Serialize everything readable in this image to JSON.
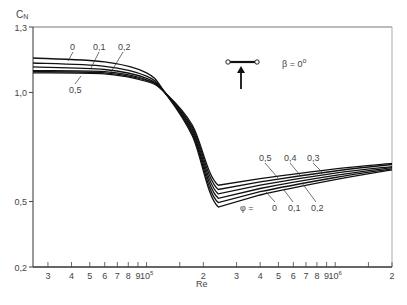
{
  "chart_data": {
    "type": "line",
    "title": "",
    "ylabel": "C_N",
    "xlabel": "Re",
    "x_scale": "log",
    "y_scale": "linear",
    "xlim": [
      25000,
      2000000
    ],
    "ylim": [
      0.2,
      1.3
    ],
    "y_ticks": [
      {
        "value": 1.3,
        "label": "1,3"
      },
      {
        "value": 1.0,
        "label": "1,0"
      },
      {
        "value": 0.5,
        "label": "0,5"
      },
      {
        "value": 0.2,
        "label": "0,2"
      }
    ],
    "x_ticks": [
      {
        "value": 30000,
        "label": "3"
      },
      {
        "value": 40000,
        "label": "4"
      },
      {
        "value": 50000,
        "label": "5"
      },
      {
        "value": 60000,
        "label": "6"
      },
      {
        "value": 70000,
        "label": "7"
      },
      {
        "value": 80000,
        "label": "8"
      },
      {
        "value": 90000,
        "label": "9"
      },
      {
        "value": 100000,
        "label": "10",
        "sup": "5"
      },
      {
        "value": 150000,
        "label": ""
      },
      {
        "value": 200000,
        "label": "2"
      },
      {
        "value": 300000,
        "label": "3"
      },
      {
        "value": 400000,
        "label": "4"
      },
      {
        "value": 500000,
        "label": "5"
      },
      {
        "value": 600000,
        "label": "6"
      },
      {
        "value": 700000,
        "label": "7"
      },
      {
        "value": 800000,
        "label": "8"
      },
      {
        "value": 900000,
        "label": "9"
      },
      {
        "value": 1000000,
        "label": "10",
        "sup": "6"
      },
      {
        "value": 1500000,
        "label": ""
      },
      {
        "value": 2000000,
        "label": "2"
      }
    ],
    "grid": false,
    "legend": "inline labels",
    "parameter": "φ",
    "annotation": {
      "beta": "β = 0°",
      "sketch": "flat plate with arrow (flow direction)"
    },
    "series": [
      {
        "name": "0",
        "points": [
          [
            25000,
            1.158
          ],
          [
            60000,
            1.14
          ],
          [
            100000,
            1.09
          ],
          [
            125000,
            1.0
          ],
          [
            175000,
            0.8
          ],
          [
            240000,
            0.475
          ],
          [
            400000,
            0.53
          ],
          [
            1000000,
            0.6
          ],
          [
            2000000,
            0.645
          ]
        ]
      },
      {
        "name": "0.1",
        "points": [
          [
            25000,
            1.135
          ],
          [
            60000,
            1.12
          ],
          [
            100000,
            1.075
          ],
          [
            125000,
            1.0
          ],
          [
            175000,
            0.81
          ],
          [
            240000,
            0.495
          ],
          [
            400000,
            0.545
          ],
          [
            1000000,
            0.61
          ],
          [
            2000000,
            0.65
          ]
        ]
      },
      {
        "name": "0.2",
        "points": [
          [
            25000,
            1.117
          ],
          [
            60000,
            1.105
          ],
          [
            100000,
            1.065
          ],
          [
            125000,
            1.0
          ],
          [
            175000,
            0.82
          ],
          [
            240000,
            0.515
          ],
          [
            400000,
            0.56
          ],
          [
            1000000,
            0.62
          ],
          [
            2000000,
            0.655
          ]
        ]
      },
      {
        "name": "0.3",
        "points": [
          [
            25000,
            1.1
          ],
          [
            60000,
            1.095
          ],
          [
            100000,
            1.058
          ],
          [
            125000,
            1.0
          ],
          [
            175000,
            0.83
          ],
          [
            240000,
            0.535
          ],
          [
            400000,
            0.575
          ],
          [
            1000000,
            0.63
          ],
          [
            2000000,
            0.66
          ]
        ]
      },
      {
        "name": "0.4",
        "points": [
          [
            25000,
            1.095
          ],
          [
            60000,
            1.09
          ],
          [
            100000,
            1.055
          ],
          [
            125000,
            1.0
          ],
          [
            175000,
            0.84
          ],
          [
            240000,
            0.555
          ],
          [
            400000,
            0.59
          ],
          [
            1000000,
            0.64
          ],
          [
            2000000,
            0.67
          ]
        ]
      },
      {
        "name": "0.5",
        "points": [
          [
            25000,
            1.09
          ],
          [
            60000,
            1.085
          ],
          [
            100000,
            1.05
          ],
          [
            125000,
            1.0
          ],
          [
            175000,
            0.85
          ],
          [
            240000,
            0.575
          ],
          [
            400000,
            0.605
          ],
          [
            1000000,
            0.65
          ],
          [
            2000000,
            0.675
          ]
        ]
      }
    ]
  },
  "labels": {
    "y_axis_title": "C",
    "y_axis_sub": "N",
    "x_axis_title": "Re",
    "beta": "β = 0",
    "beta_deg": "o",
    "phi_eq": "φ =",
    "top_0": "0",
    "top_01": "0,1",
    "top_02": "0,2",
    "top_05": "0,5",
    "bot_05": "0,5",
    "bot_04": "0,4",
    "bot_03": "0,3",
    "bot_0": "0",
    "bot_01": "0,1",
    "bot_02": "0,2"
  }
}
